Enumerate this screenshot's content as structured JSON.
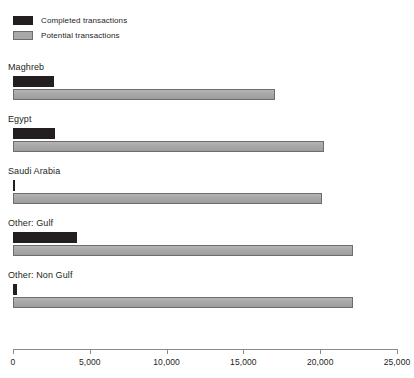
{
  "legend": {
    "position": "top-left",
    "items": [
      {
        "label": "Completed transactions",
        "color": "#231f20",
        "swatch": "completed"
      },
      {
        "label": "Potential transactions",
        "color": "#a8a8a8",
        "swatch": "potential"
      }
    ]
  },
  "axis": {
    "min": 0,
    "max": 25000,
    "ticks": [
      0,
      5000,
      10000,
      15000,
      20000,
      25000
    ],
    "tick_labels": [
      "0",
      "5,000",
      "10,000",
      "15,000",
      "20,000",
      "25,000"
    ]
  },
  "chart_data": {
    "type": "bar",
    "orientation": "horizontal",
    "title": "",
    "subtitle": "",
    "xlabel": "",
    "ylabel": "",
    "xlim": [
      0,
      25000
    ],
    "grid": false,
    "legend_position": "top-left",
    "categories": [
      "Maghreb",
      "Egypt",
      "Saudi Arabia",
      "Other: Gulf",
      "Other: Non Gulf"
    ],
    "series": [
      {
        "name": "Completed transactions",
        "color": "#231f20",
        "values": [
          2670,
          2750,
          60,
          4170,
          260
        ]
      },
      {
        "name": "Potential transactions",
        "color": "#a8a8a8",
        "values": [
          17060,
          20250,
          20100,
          22140,
          22140
        ]
      }
    ]
  }
}
